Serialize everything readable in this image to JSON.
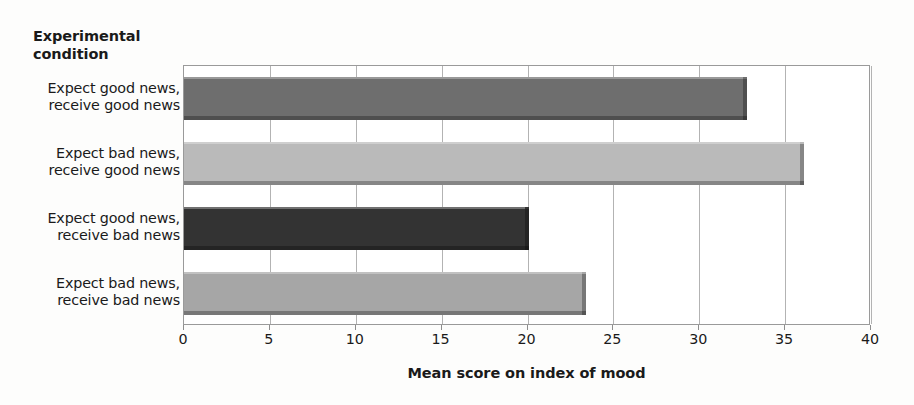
{
  "chart_data": {
    "type": "bar",
    "orientation": "horizontal",
    "title": "",
    "subtitle": "",
    "xlabel": "Mean score on index of mood",
    "ylabel": "Experimental condition",
    "categories": [
      "Expect good news, receive good news",
      "Expect bad news, receive good news",
      "Expect good news, receive bad news",
      "Expect bad news, receive bad news"
    ],
    "category_lines": [
      [
        "Expect good news,",
        "receive good news"
      ],
      [
        "Expect bad news,",
        "receive good news"
      ],
      [
        "Expect good news,",
        "receive bad news"
      ],
      [
        "Expect bad news,",
        "receive bad news"
      ]
    ],
    "values": [
      32.8,
      36.1,
      20.1,
      23.4
    ],
    "bar_colors": [
      "#6e6e6e",
      "#bababa",
      "#333333",
      "#a6a6a6"
    ],
    "xlim": [
      0,
      40
    ],
    "xticks": [
      0,
      5,
      10,
      15,
      20,
      25,
      30,
      35,
      40
    ],
    "xtick_labels": [
      "0",
      "5",
      "10",
      "15",
      "20",
      "25",
      "30",
      "35",
      "40"
    ],
    "grid": "vertical",
    "legend": "none",
    "annotations": []
  },
  "axes": {
    "y_title_lines": [
      "Experimental",
      "condition"
    ],
    "x_title": "Mean score on index of mood"
  }
}
